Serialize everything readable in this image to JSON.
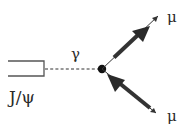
{
  "diagram": {
    "type": "feynman",
    "colors": {
      "background": "#ffffff",
      "ink": "#2a2a2a",
      "box_stroke": "#555555"
    },
    "nodes": [
      {
        "id": "jpsi",
        "label": "J/ψ",
        "shape": "open-rectangle"
      },
      {
        "id": "vertex",
        "label": "",
        "shape": "filled-dot"
      },
      {
        "id": "mu_top",
        "label": "μ"
      },
      {
        "id": "mu_bottom",
        "label": "μ"
      }
    ],
    "edges": [
      {
        "from": "jpsi",
        "to": "vertex",
        "label": "γ",
        "style": "dashed"
      },
      {
        "from": "vertex",
        "to": "mu_top",
        "style": "arrow-outgoing"
      },
      {
        "from": "mu_bottom",
        "to": "vertex",
        "style": "arrow-incoming"
      }
    ]
  },
  "labels": {
    "jpsi": "J/ψ",
    "photon": "γ",
    "mu_top": "μ",
    "mu_bottom": "μ"
  }
}
